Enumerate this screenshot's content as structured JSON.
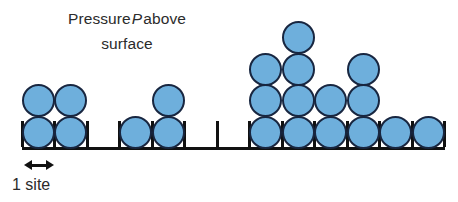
{
  "figure": {
    "kind": "lattice-adsorption-diagram",
    "caption": {
      "line1_before": "Pressure",
      "line1_symbol": "P",
      "line1_after": "above",
      "line2": "surface"
    },
    "scale_label": "1 site",
    "colors": {
      "particle_fill": "#6eafdc",
      "particle_outline": "#182640",
      "lattice_line": "#111111",
      "text": "#2b2b2b",
      "background": "#ffffff"
    },
    "lattice": {
      "site_count": 13,
      "site_width_px": 32.5,
      "origin_x_px": 22,
      "baseline_y_px": 147,
      "baseline_thickness_px": 3,
      "tick_height_px": 26,
      "tick_thickness_px": 3,
      "tick_x_positions": [
        22,
        54.5,
        87,
        119.5,
        152,
        184.5,
        217,
        249.5,
        282,
        314.5,
        347,
        379.5,
        412,
        444.5
      ],
      "ball_diameter_px": 33,
      "occupancy": [
        2,
        2,
        0,
        1,
        2,
        0,
        0,
        3,
        4,
        2,
        3,
        1,
        1
      ]
    },
    "ruler": {
      "x_px": 24,
      "y_px": 160,
      "length_px": 30
    }
  }
}
